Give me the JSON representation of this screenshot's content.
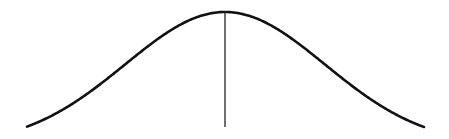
{
  "chart_data": {
    "type": "line",
    "title": "",
    "subtitle": "",
    "xlabel": "",
    "ylabel": "",
    "distribution": "normal",
    "mean": 0,
    "std_dev": 1,
    "x_range": [
      -2,
      2
    ],
    "grid": false,
    "legend": null,
    "annotations": [
      {
        "type": "vertical_line",
        "x": 0,
        "label": ""
      }
    ],
    "series": [
      {
        "name": "density",
        "x": [
          -2,
          -1.5,
          -1,
          -0.5,
          0,
          0.5,
          1,
          1.5,
          2
        ],
        "values": [
          0.054,
          0.13,
          0.242,
          0.352,
          0.399,
          0.352,
          0.242,
          0.13,
          0.054
        ]
      }
    ]
  },
  "style": {
    "curve_color": "#111111",
    "mean_line_color": "#222222",
    "background": "#ffffff"
  },
  "layout_px": {
    "x_left": 27,
    "x_right": 424,
    "x_center": 225,
    "y_peak": 12,
    "y_base": 127,
    "sigma_px": 100
  }
}
